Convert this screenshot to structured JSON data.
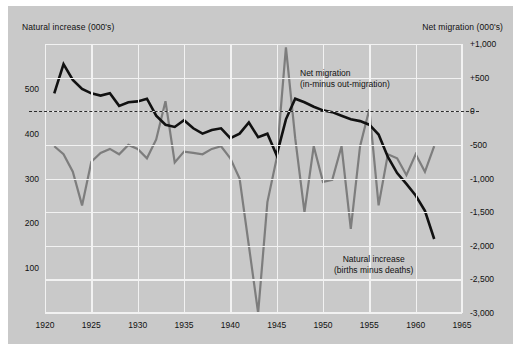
{
  "figure": {
    "left_axis_title": "Natural increase (000's)",
    "right_axis_title": "Net migration (000's)"
  },
  "annotations": {
    "migration_line1": "Net migration",
    "migration_line2": "(in-minus out-migration)",
    "natural_line1": "Natural increase",
    "natural_line2": "(births minus deaths)"
  },
  "colors": {
    "background": "#c9c9c9",
    "grid": "#f2f2f2",
    "natural_increase": "#111111",
    "net_migration": "#7d7d7d",
    "zero_line": "#2b2b2b"
  },
  "chart_data": {
    "type": "line",
    "title": "",
    "xlabel": "",
    "ylabel": "Natural increase (000's)",
    "y2label": "Net migration (000's)",
    "grid": true,
    "legend": "annotations-inline",
    "xlim": [
      1920,
      1965
    ],
    "xticks": [
      1920,
      1925,
      1930,
      1935,
      1940,
      1945,
      1950,
      1955,
      1960,
      1965
    ],
    "xticklabels": [
      "1920",
      "1925",
      "1930",
      "1935",
      "1940",
      "1945",
      "1950",
      "1955",
      "1960",
      "1965"
    ],
    "ylim": [
      0,
      600
    ],
    "yticks": [
      100,
      200,
      300,
      400,
      500
    ],
    "yticklabels": [
      "100",
      "200",
      "300",
      "400",
      "500"
    ],
    "y2lim": [
      -3000,
      1000
    ],
    "y2ticks": [
      1000,
      500,
      0,
      -500,
      -1000,
      -1500,
      -2000,
      -2500,
      -3000
    ],
    "y2ticklabels": [
      "+1,000",
      "+500",
      "0",
      "-500",
      "-1,000",
      "-1,500",
      "-2,000",
      "-2,500",
      "-3,000"
    ],
    "series": [
      {
        "name": "Natural increase (births minus deaths)",
        "axis": "left",
        "color": "#111111",
        "x": [
          1921,
          1922,
          1923,
          1924,
          1925,
          1926,
          1927,
          1928,
          1929,
          1930,
          1931,
          1932,
          1933,
          1934,
          1935,
          1936,
          1937,
          1938,
          1939,
          1940,
          1941,
          1942,
          1943,
          1944,
          1945,
          1946,
          1947,
          1948,
          1949,
          1950,
          1951,
          1952,
          1953,
          1954,
          1955,
          1956,
          1957,
          1958,
          1959,
          1960,
          1961,
          1962
        ],
        "values": [
          490,
          555,
          520,
          500,
          490,
          485,
          490,
          462,
          470,
          472,
          478,
          440,
          420,
          415,
          430,
          412,
          400,
          408,
          412,
          390,
          400,
          425,
          392,
          400,
          352,
          432,
          478,
          470,
          460,
          452,
          448,
          440,
          432,
          428,
          420,
          398,
          348,
          312,
          288,
          262,
          228,
          165
        ]
      },
      {
        "name": "Net migration (in-minus out-migration)",
        "axis": "right",
        "color": "#7d7d7d",
        "x": [
          1921,
          1922,
          1923,
          1924,
          1925,
          1926,
          1927,
          1928,
          1929,
          1930,
          1931,
          1932,
          1933,
          1934,
          1935,
          1936,
          1937,
          1938,
          1939,
          1940,
          1941,
          1942,
          1943,
          1944,
          1945,
          1946,
          1947,
          1948,
          1949,
          1950,
          1951,
          1952,
          1953,
          1954,
          1955,
          1956,
          1957,
          1958,
          1959,
          1960,
          1961,
          1962
        ],
        "values": [
          -520,
          -640,
          -900,
          -1400,
          -750,
          -620,
          -560,
          -640,
          -500,
          -560,
          -700,
          -420,
          150,
          -760,
          -600,
          -620,
          -640,
          -560,
          -520,
          -700,
          -1000,
          -2000,
          -3000,
          -1350,
          -700,
          950,
          -400,
          -1500,
          -520,
          -1050,
          -1020,
          -520,
          -1750,
          -520,
          30,
          -1400,
          -640,
          -700,
          -950,
          -640,
          -900,
          -520
        ]
      }
    ]
  }
}
